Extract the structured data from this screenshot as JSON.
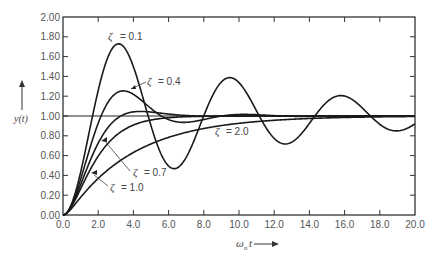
{
  "chart_data": {
    "type": "line",
    "title": "",
    "xlabel": "ωn t",
    "ylabel": "y(t)",
    "xlim": [
      0.0,
      20.0
    ],
    "ylim": [
      0.0,
      2.0
    ],
    "grid": false,
    "legend": "inline annotations",
    "x_ticks": [
      "0.0",
      "2.0",
      "4.0",
      "6.0",
      "8.0",
      "10.0",
      "12.0",
      "14.0",
      "16.0",
      "18.0",
      "20.0"
    ],
    "y_ticks": [
      "0.00",
      "0.20",
      "0.40",
      "0.60",
      "0.80",
      "1.00",
      "1.20",
      "1.40",
      "1.60",
      "1.80",
      "2.00"
    ],
    "reference_line": {
      "y": 1.0,
      "label": "steady state"
    },
    "series": [
      {
        "name": "ζ = 0.1",
        "zeta": 0.1,
        "peak": {
          "x": 3.1,
          "y": 1.73
        }
      },
      {
        "name": "ζ = 0.4",
        "zeta": 0.4,
        "peak": {
          "x": 3.4,
          "y": 1.25
        }
      },
      {
        "name": "ζ = 0.7",
        "zeta": 0.7,
        "peak": {
          "x": 4.4,
          "y": 1.05
        }
      },
      {
        "name": "ζ = 1.0",
        "zeta": 1.0
      },
      {
        "name": "ζ = 2.0",
        "zeta": 2.0
      }
    ],
    "annotations": [
      {
        "text": "ζ = 0.1",
        "x": 2.4,
        "y": 1.8
      },
      {
        "text": "ζ = 0.4",
        "x": 4.6,
        "y": 1.38
      },
      {
        "text": "ζ = 0.7",
        "x": 4.1,
        "y": 0.46
      },
      {
        "text": "ζ = 1.0",
        "x": 2.8,
        "y": 0.3
      },
      {
        "text": "ζ = 2.0",
        "x": 8.6,
        "y": 0.88
      }
    ]
  },
  "labels": {
    "y_axis": "y(t)",
    "x_axis_main": "ω",
    "x_axis_sub": "n",
    "x_axis_t": "t",
    "zeta_symbol": "ζ",
    "anno": {
      "z01": "= 0.1",
      "z04": "= 0.4",
      "z07": "= 0.7",
      "z10": "= 1.0",
      "z20": "= 2.0"
    }
  }
}
